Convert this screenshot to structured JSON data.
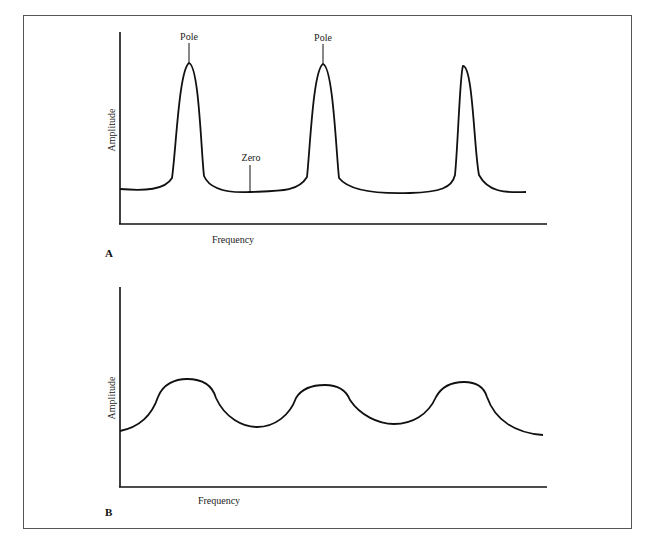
{
  "figure": {
    "panels": [
      {
        "id": "A",
        "label": "A",
        "xlabel": "Frequency",
        "ylabel": "Amplitude",
        "annotations": [
          {
            "text": "Pole",
            "target": "first peak"
          },
          {
            "text": "Pole",
            "target": "second peak"
          },
          {
            "text": "Zero",
            "target": "trough between first and second peak"
          }
        ],
        "description": "Three sharp, narrow resonance peaks (poles) above a low flat baseline with shallow troughs (zeros)"
      },
      {
        "id": "B",
        "label": "B",
        "xlabel": "Frequency",
        "ylabel": "Amplitude",
        "annotations": [],
        "description": "Three broad, rounded humps with deep smooth troughs between them"
      }
    ]
  },
  "labels": {
    "a_panel": "A",
    "b_panel": "B",
    "a_xlabel": "Frequency",
    "a_ylabel": "Amplitude",
    "b_xlabel": "Frequency",
    "b_ylabel": "Amplitude",
    "pole1": "Pole",
    "pole2": "Pole",
    "zero": "Zero"
  },
  "colors": {
    "line": "#111111",
    "frame": "#555555",
    "background": "#ffffff"
  }
}
